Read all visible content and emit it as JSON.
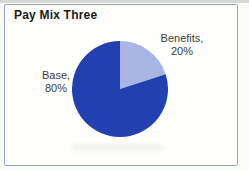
{
  "page": {
    "title": "Pay Mix Three"
  },
  "chart_data": {
    "type": "pie",
    "title": "Pay Mix Three",
    "direction": "clockwise",
    "start_angle": "12 o'clock",
    "categories": [
      "Benefits",
      "Base"
    ],
    "values": [
      20,
      80
    ],
    "colors": [
      "#a9b5e3",
      "#2340b0"
    ],
    "slices": [
      {
        "name": "Benefits",
        "percent": 20,
        "color": "#a9b5e3",
        "label_line1": "Benefits,",
        "label_line2": "20%"
      },
      {
        "name": "Base",
        "percent": 80,
        "color": "#2340b0",
        "label_line1": "Base,",
        "label_line2": "80%"
      }
    ],
    "legend": "none",
    "colors_meta": {
      "panel_border": "#96a4ce",
      "panel_background": "#fefefd",
      "title_color": "#1b1b1b",
      "label_color": "#3d3d3d"
    }
  }
}
